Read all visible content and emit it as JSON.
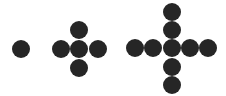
{
  "diagram": {
    "type": "dot-pattern-sequence",
    "dot_color": "#262626",
    "dot_diameter": 18,
    "figures": [
      {
        "index": 1,
        "dot_count": 1,
        "dots": [
          [
            21,
            49
          ]
        ]
      },
      {
        "index": 2,
        "dot_count": 5,
        "dots": [
          [
            79,
            30
          ],
          [
            61,
            49
          ],
          [
            79,
            49
          ],
          [
            98,
            49
          ],
          [
            79,
            68
          ]
        ]
      },
      {
        "index": 3,
        "dot_count": 9,
        "dots": [
          [
            172,
            12
          ],
          [
            172,
            30
          ],
          [
            135,
            48
          ],
          [
            153,
            48
          ],
          [
            172,
            48
          ],
          [
            190,
            48
          ],
          [
            208,
            48
          ],
          [
            172,
            67
          ],
          [
            172,
            85
          ]
        ]
      }
    ]
  }
}
